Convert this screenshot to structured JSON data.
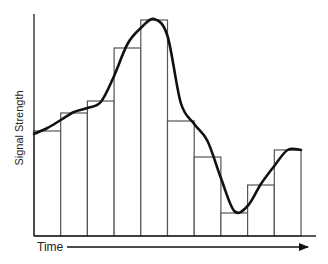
{
  "chart_data": {
    "type": "bar",
    "title": "",
    "xlabel": "Time",
    "ylabel": "Signal Strength",
    "grid": false,
    "legend": null,
    "categories": [
      "1",
      "2",
      "3",
      "4",
      "5",
      "6",
      "7",
      "8",
      "9",
      "10"
    ],
    "values": [
      105,
      123,
      135,
      188,
      216,
      115,
      79,
      23,
      51,
      86
    ],
    "ylim": [
      0,
      222
    ],
    "overlay_curve": {
      "type": "line",
      "description": "Smooth continuous signal curve overlaid on histogram bars",
      "points": [
        [
          0,
          102
        ],
        [
          0.5,
          108
        ],
        [
          1,
          116
        ],
        [
          1.5,
          124
        ],
        [
          2,
          128
        ],
        [
          2.5,
          134
        ],
        [
          3,
          160
        ],
        [
          3.5,
          192
        ],
        [
          4,
          208
        ],
        [
          4.5,
          217
        ],
        [
          5,
          200
        ],
        [
          5.5,
          133
        ],
        [
          6,
          112
        ],
        [
          6.5,
          95
        ],
        [
          7,
          58
        ],
        [
          7.5,
          25
        ],
        [
          8,
          30
        ],
        [
          8.5,
          52
        ],
        [
          9,
          70
        ],
        [
          9.5,
          86
        ],
        [
          10,
          86
        ]
      ]
    },
    "x_axis_arrow": true
  },
  "labels": {
    "y_axis": "Signal Strength",
    "x_axis": "Time"
  }
}
